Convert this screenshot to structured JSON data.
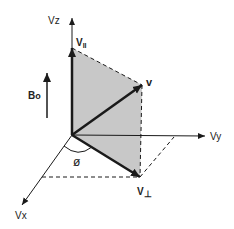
{
  "diagram": {
    "axes": {
      "x": "Vx",
      "y": "Vy",
      "z": "Vz"
    },
    "vectors": {
      "total": "v",
      "parallel": "V",
      "parallel_sub": "II",
      "perp": "V",
      "perp_sub": "⊥"
    },
    "field": {
      "label": "B",
      "sub": "o"
    },
    "angle": "ø",
    "colors": {
      "plane_fill": "#c8c8c8",
      "line": "#1a1a1a"
    }
  }
}
